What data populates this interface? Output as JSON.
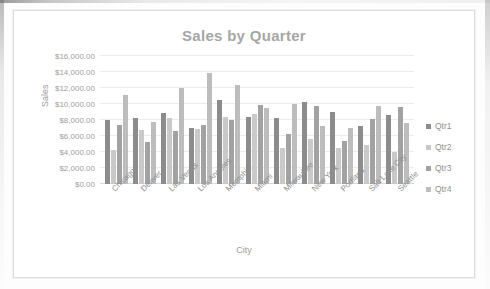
{
  "chart_data": {
    "type": "bar",
    "title": "Sales by Quarter",
    "xlabel": "City",
    "ylabel": "Sales",
    "grid": true,
    "legend_position": "right",
    "ylim": [
      0,
      16000
    ],
    "ytick_values": [
      0,
      2000,
      4000,
      6000,
      8000,
      10000,
      12000,
      14000,
      16000
    ],
    "ytick_labels": [
      "$0.00",
      "$2,000.00",
      "$4,000.00",
      "$6,000.00",
      "$8,000.00",
      "$10,000.00",
      "$12,000.00",
      "$14,000.00",
      "$16,000.00"
    ],
    "categories": [
      "Chicago",
      "Denver",
      "Las Vegas",
      "Los Angeles",
      "Memphis",
      "Miami",
      "Milwaukee",
      "New York",
      "Portland",
      "Salt Lake City",
      "Seattle"
    ],
    "series": [
      {
        "name": "Qtr1",
        "color": "#8c8c8c",
        "values": [
          8000,
          8200,
          8900,
          7000,
          10500,
          8400,
          8200,
          10200,
          9000,
          7200,
          8600
        ]
      },
      {
        "name": "Qtr2",
        "color": "#c9c9c9",
        "values": [
          4200,
          6800,
          8300,
          6900,
          8400,
          8700,
          4500,
          5600,
          4500,
          4900,
          4000
        ]
      },
      {
        "name": "Qtr3",
        "color": "#a2a2a2",
        "values": [
          7400,
          5300,
          6600,
          7400,
          8000,
          9900,
          6200,
          9800,
          5400,
          8100,
          9600
        ]
      },
      {
        "name": "Qtr4",
        "color": "#bdbdbd",
        "values": [
          11100,
          7800,
          12000,
          13900,
          12400,
          9500,
          10000,
          7300,
          7000,
          9700,
          7600
        ]
      }
    ]
  },
  "legend": {
    "items": [
      {
        "label": "Qtr1"
      },
      {
        "label": "Qtr2"
      },
      {
        "label": "Qtr3"
      },
      {
        "label": "Qtr4"
      }
    ]
  }
}
